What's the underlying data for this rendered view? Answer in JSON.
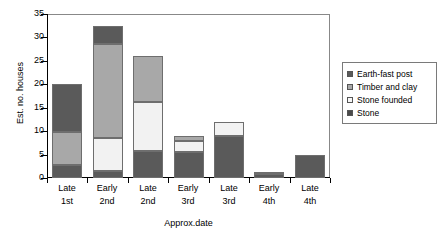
{
  "chart_data": {
    "type": "bar",
    "stacked": true,
    "title": "",
    "xlabel": "Approx.date",
    "ylabel": "Est. no. houses",
    "ylim": [
      0,
      35
    ],
    "yticks": [
      0,
      5,
      10,
      15,
      20,
      25,
      30,
      35
    ],
    "grid": false,
    "legend_position": "right",
    "categories": [
      "Late 1st",
      "Early 2nd",
      "Late 2nd",
      "Early 3rd",
      "Late 3rd",
      "Early 4th",
      "Late 4th"
    ],
    "category_lines": [
      [
        "Late",
        "1st"
      ],
      [
        "Early",
        "2nd"
      ],
      [
        "Late",
        "2nd"
      ],
      [
        "Early",
        "3rd"
      ],
      [
        "Late",
        "3rd"
      ],
      [
        "Early",
        "4th"
      ],
      [
        "Late",
        "4th"
      ]
    ],
    "series": [
      {
        "name": "Stone",
        "color": "#5a5a5a",
        "values": [
          2.7,
          1.5,
          5.8,
          5.5,
          9.0,
          0.8,
          5.0
        ]
      },
      {
        "name": "Stone founded",
        "color": "#f2f2f2",
        "values": [
          0.0,
          7.0,
          10.4,
          2.5,
          3.0,
          0.0,
          0.0
        ]
      },
      {
        "name": "Timber and clay",
        "color": "#a8a8a8",
        "values": [
          7.1,
          20.0,
          9.8,
          1.0,
          0.0,
          0.3,
          0.0
        ]
      },
      {
        "name": "Earth-fast post",
        "color": "#5a5a5a",
        "values": [
          10.2,
          4.0,
          0.0,
          0.0,
          0.0,
          0.0,
          0.0
        ]
      }
    ],
    "totals": [
      20.0,
      32.5,
      26.0,
      9.0,
      12.0,
      1.1,
      5.0
    ]
  },
  "legend": {
    "items": [
      {
        "label": "Earth-fast post",
        "color": "#5a5a5a"
      },
      {
        "label": "Timber and clay",
        "color": "#a8a8a8"
      },
      {
        "label": "Stone founded",
        "color": "#f7f7f7"
      },
      {
        "label": "Stone",
        "color": "#4a4a4a"
      }
    ]
  }
}
